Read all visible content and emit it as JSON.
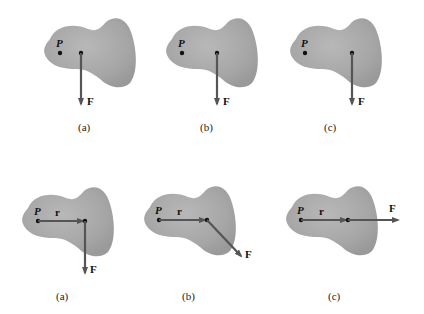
{
  "figure": {
    "colors": {
      "body": "#a9a9a9",
      "body_edge": "#9a9a9a",
      "arrow": "#555555",
      "dot": "#111111"
    },
    "top_row": [
      {
        "id": "a",
        "caption": "(a)",
        "point_label": "P",
        "force_label": "F",
        "force_direction": "down"
      },
      {
        "id": "b",
        "caption": "(b)",
        "point_label": "P",
        "force_label": "F",
        "force_direction": "down"
      },
      {
        "id": "c",
        "caption": "(c)",
        "point_label": "P",
        "force_label": "F",
        "force_direction": "down"
      }
    ],
    "bottom_row": [
      {
        "id": "a",
        "caption": "(a)",
        "point_label": "P",
        "vector_label": "r",
        "force_label": "F",
        "force_direction": "down"
      },
      {
        "id": "b",
        "caption": "(b)",
        "point_label": "P",
        "vector_label": "r",
        "force_label": "F",
        "force_direction": "down-right"
      },
      {
        "id": "c",
        "caption": "(c)",
        "point_label": "P",
        "vector_label": "r",
        "force_label": "F",
        "force_direction": "right"
      }
    ]
  }
}
